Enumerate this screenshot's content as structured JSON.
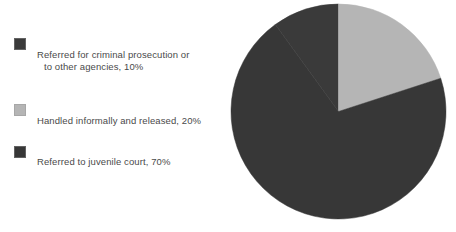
{
  "chart_data": {
    "type": "pie",
    "title": "",
    "subtitle": "",
    "xlabel": "",
    "ylabel": "",
    "grid": false,
    "legend_position": "left",
    "units": "percent",
    "total": 100,
    "start_angle_deg": 0,
    "direction": "clockwise",
    "categories": [
      "Referred for criminal prosecution or to other agencies",
      "Handled informally and released",
      "Referred to juvenile court"
    ],
    "values": [
      10,
      20,
      70
    ],
    "value_labels": [
      "10%",
      "20%",
      "70%"
    ],
    "colors": [
      "#3a3a3a",
      "#b5b5b5",
      "#373737"
    ],
    "slices": [
      {
        "label": "Referred for criminal prosecution or to other agencies",
        "label_line1": "Referred for criminal prosecution or",
        "label_line2": "to other agencies, 10%",
        "legend_text": "Referred for criminal prosecution or to other agencies, 10%",
        "value": 10,
        "value_label": "10%",
        "color": "#3a3a3a",
        "start_deg": 324,
        "end_deg": 360
      },
      {
        "label": "Handled informally and released",
        "label_line1": "Handled informally and released, 20%",
        "label_line2": "",
        "legend_text": "Handled informally and released, 20%",
        "value": 20,
        "value_label": "20%",
        "color": "#b5b5b5",
        "start_deg": 0,
        "end_deg": 72
      },
      {
        "label": "Referred to juvenile court",
        "label_line1": "Referred to juvenile court, 70%",
        "label_line2": "",
        "legend_text": "Referred to juvenile court, 70%",
        "value": 70,
        "value_label": "70%",
        "color": "#373737",
        "start_deg": 72,
        "end_deg": 324
      }
    ]
  },
  "legend": {
    "items": [
      {
        "swatch_color": "#3a3a3a",
        "line1": "Referred for criminal prosecution or",
        "line2": "to other agencies, 10%"
      },
      {
        "swatch_color": "#b5b5b5",
        "line1": "Handled informally and released, 20%",
        "line2": ""
      },
      {
        "swatch_color": "#373737",
        "line1": "Referred to juvenile court, 70%",
        "line2": ""
      }
    ]
  },
  "colors": {
    "background": "#ffffff",
    "dark_slice": "#3a3a3a",
    "light_slice": "#b5b5b5",
    "text": "#4a4a4a"
  }
}
